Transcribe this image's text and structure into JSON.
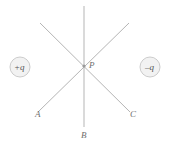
{
  "figure": {
    "name": "electric-dipole-field-direction-diagram",
    "background_color": "#ffffff",
    "width": 169,
    "height": 148
  },
  "charges": {
    "positive": {
      "label": "+q",
      "icon": "positive-charge-icon",
      "cx": 20,
      "cy": 67,
      "r": 10,
      "fill": "#f2f2f2",
      "stroke": "#cccccc"
    },
    "negative": {
      "label": "–q",
      "icon": "negative-charge-icon",
      "cx": 150,
      "cy": 67,
      "r": 10,
      "fill": "#f2f2f2",
      "stroke": "#cccccc"
    }
  },
  "point": {
    "label": "P",
    "x": 84,
    "y": 66
  },
  "lines": {
    "color": "#b5b5b5",
    "width": 1,
    "items": [
      {
        "name": "vertical-line-PB",
        "x1": 84,
        "y1": 6,
        "x2": 84,
        "y2": 127
      },
      {
        "name": "diagonal-line-A",
        "x1": 40,
        "y1": 23,
        "x2": 38,
        "y2": 112
      },
      {
        "name": "diagonal-line-C",
        "x1": 129,
        "y1": 23,
        "x2": 130,
        "y2": 112
      }
    ]
  },
  "labels": {
    "P": "P",
    "A": "A",
    "B": "B",
    "C": "C"
  },
  "colors": {
    "line": "#b5b5b5",
    "label_text": "#6e6e6e",
    "charge_text": "#555555",
    "charge_fill": "#f2f2f2",
    "charge_stroke": "#cccccc"
  }
}
